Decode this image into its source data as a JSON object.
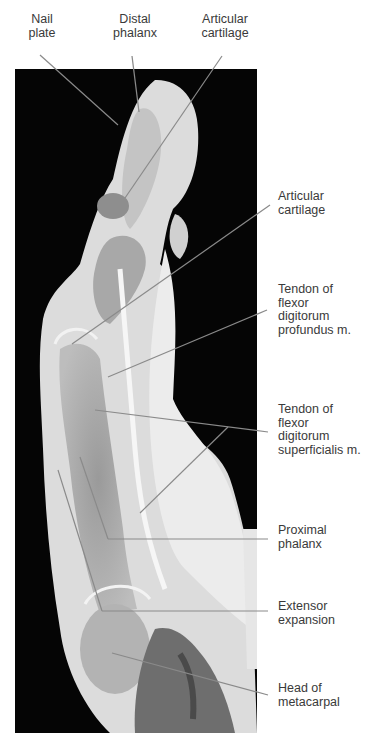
{
  "figure": {
    "background_color": "#050505",
    "leader_color": "#8a8a8a"
  },
  "labels": {
    "top": [
      {
        "id": "nail-plate",
        "text": "Nail\nplate"
      },
      {
        "id": "distal-phalanx",
        "text": "Distal\nphalanx"
      },
      {
        "id": "articular-cartilage-top",
        "text": "Articular\ncartilage"
      }
    ],
    "side": [
      {
        "id": "articular-cartilage",
        "text": "Articular\ncartilage"
      },
      {
        "id": "tendon-fdp",
        "text": "Tendon of\nflexor\ndigitorum\nprofundus m."
      },
      {
        "id": "tendon-fds",
        "text": "Tendon of\nflexor\ndigitorum\nsuperficialis m."
      },
      {
        "id": "proximal-phalanx",
        "text": "Proximal\nphalanx"
      },
      {
        "id": "extensor-expansion",
        "text": "Extensor\nexpansion"
      },
      {
        "id": "head-metacarpal",
        "text": "Head of\nmetacarpal"
      }
    ]
  }
}
